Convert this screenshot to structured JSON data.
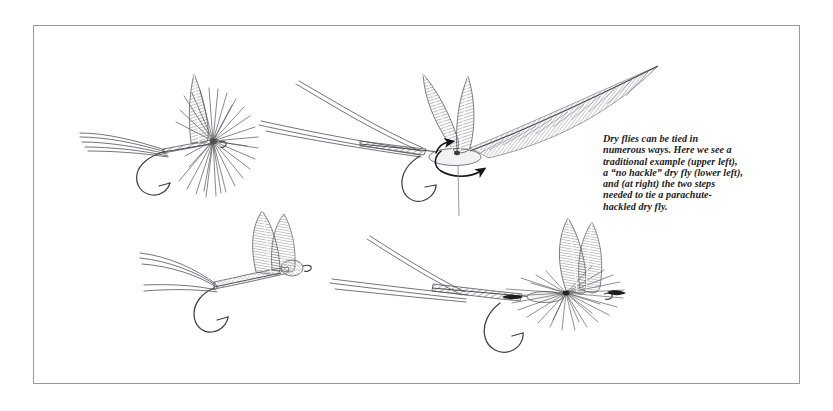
{
  "plate": {
    "title": "Dry flies tying illustration plate",
    "frame_color": "#9a9a9e",
    "background_color": "#ffffff",
    "ink_color": "#3a3a3c"
  },
  "caption": {
    "text": "Dry flies can be tied in numerous ways. Here we see a traditional example (upper left), a “no hackle” dry fly (lower left), and (at right) the two steps needed to tie a parachute-hackled dry fly.",
    "lines": [
      "Dry flies can be tied in",
      "numerous ways. Here we",
      "see a traditional example",
      "(upper left), a “no hackle”",
      "dry fly (lower left), and (at",
      "right) the two steps needed",
      "to tie a parachute-hackled",
      "dry fly."
    ]
  },
  "figures": [
    {
      "id": "traditional-dry-fly",
      "label": "traditional dry fly",
      "position": "upper left",
      "parts": [
        "tail fibers",
        "segmented body",
        "upright wings",
        "radiating hackle collar",
        "hook with barb"
      ]
    },
    {
      "id": "no-hackle-dry-fly",
      "label": "no hackle dry fly",
      "position": "lower left",
      "parts": [
        "tail fibers",
        "stippled body",
        "paired hatched wings",
        "hook with barb"
      ]
    },
    {
      "id": "parachute-step-one",
      "label": "parachute hackle step one",
      "position": "upper right",
      "parts": [
        "tail fibers",
        "body",
        "wing post",
        "hackle feather",
        "wrapping arrows",
        "hanging thread",
        "hook with barb"
      ]
    },
    {
      "id": "parachute-step-two",
      "label": "parachute hackle step two finished fly",
      "position": "lower right",
      "parts": [
        "tail fibers",
        "segmented body",
        "upright wings",
        "horizontal parachute hackle",
        "hook with barb"
      ]
    }
  ]
}
